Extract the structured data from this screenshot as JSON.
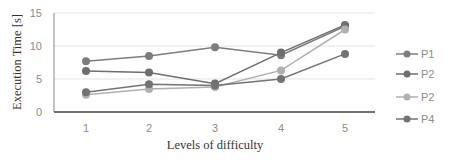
{
  "chart_data": {
    "type": "line",
    "title": "",
    "xlabel": "Levels of difficulty",
    "ylabel": "Execution Time [s]",
    "categories": [
      "1",
      "2",
      "3",
      "4",
      "5"
    ],
    "ylim": [
      0,
      15
    ],
    "yticks": [
      "0",
      "5",
      "10",
      "15"
    ],
    "grid": true,
    "legend_position": "right",
    "series": [
      {
        "name": "P1",
        "color": "#7d7d7d",
        "values": [
          7.7,
          8.5,
          9.8,
          8.6,
          13.0
        ]
      },
      {
        "name": "P2",
        "color": "#6e6e6e",
        "values": [
          6.2,
          6.0,
          4.3,
          9.0,
          13.2
        ]
      },
      {
        "name": "P2",
        "color": "#b0b0b0",
        "values": [
          2.6,
          3.5,
          3.8,
          6.3,
          12.5
        ]
      },
      {
        "name": "P4",
        "color": "#737373",
        "values": [
          3.0,
          4.2,
          4.0,
          5.0,
          8.8
        ]
      }
    ]
  }
}
